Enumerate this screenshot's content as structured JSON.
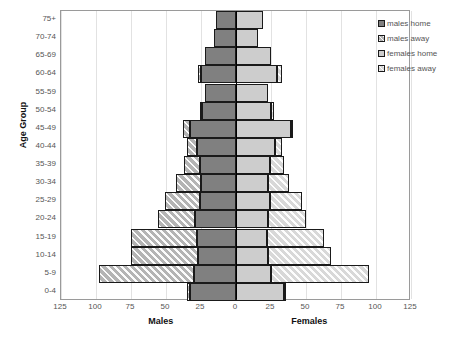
{
  "chart_data": {
    "type": "bar",
    "subtype": "population-pyramid",
    "title": "",
    "xlabel_left": "Males",
    "xlabel_right": "Females",
    "ylabel": "Age Group",
    "grid": true,
    "legend_position": "right",
    "axis_ticks": [
      "125",
      "100",
      "75",
      "50",
      "25",
      "0",
      "25",
      "50",
      "75",
      "100",
      "125"
    ],
    "axis_tick_values": [
      -125,
      -100,
      -75,
      -50,
      -25,
      0,
      25,
      50,
      75,
      100,
      125
    ],
    "xlim": [
      -125,
      125
    ],
    "categories": [
      "75+",
      "70-74",
      "65-69",
      "60-64",
      "55-59",
      "50-54",
      "45-49",
      "40-44",
      "35-39",
      "30-34",
      "25-29",
      "20-24",
      "15-19",
      "10-14",
      "5-9",
      "0-4"
    ],
    "legend": [
      "males home",
      "males away",
      "females home",
      "females away"
    ],
    "series": [
      {
        "name": "males home",
        "side": "left",
        "values": [
          14,
          16,
          22,
          25,
          22,
          24,
          33,
          28,
          26,
          25,
          26,
          29,
          28,
          27,
          30,
          33
        ]
      },
      {
        "name": "males away",
        "side": "left",
        "values": [
          0,
          0,
          0,
          2,
          0,
          2,
          5,
          7,
          11,
          18,
          25,
          27,
          47,
          48,
          68,
          2
        ]
      },
      {
        "name": "females home",
        "side": "right",
        "values": [
          19,
          16,
          25,
          29,
          23,
          25,
          39,
          28,
          24,
          23,
          24,
          23,
          22,
          23,
          25,
          34
        ]
      },
      {
        "name": "females away",
        "side": "right",
        "values": [
          0,
          0,
          0,
          4,
          0,
          2,
          2,
          5,
          10,
          15,
          23,
          27,
          41,
          45,
          70,
          2
        ]
      }
    ]
  },
  "legend": {
    "items": [
      {
        "label": "males home",
        "key": "mh"
      },
      {
        "label": "males away",
        "key": "ma"
      },
      {
        "label": "females home",
        "key": "fh"
      },
      {
        "label": "females away",
        "key": "fa"
      }
    ]
  }
}
